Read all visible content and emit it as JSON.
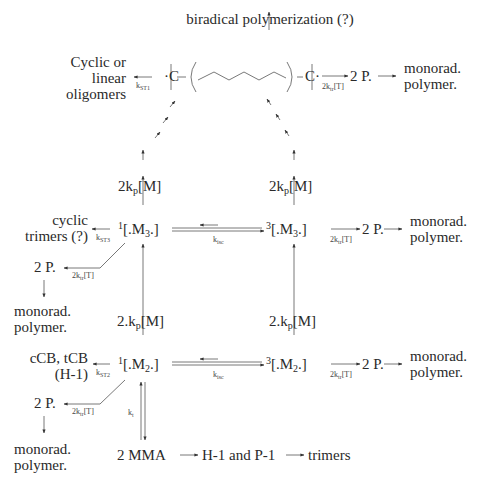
{
  "diagram": {
    "type": "reaction-scheme",
    "top": {
      "biradical_label": "biradical polymerization (?)",
      "left_product": [
        "Cyclic or",
        "linear",
        "oligomers"
      ],
      "k_st1": "ST1",
      "k_st1_prefix": "k",
      "chain_left_carbon": "C",
      "chain_right_carbon": "C",
      "transfer_rate_top": "2k",
      "transfer_rate_top_sub": "tr",
      "transfer_rate_top_suffix": "[T]",
      "product": "2 P.",
      "final": [
        "monorad.",
        "polymer."
      ]
    },
    "trimer_row": {
      "singlet_sup": "1",
      "singlet_body": "[.M",
      "singlet_sub": "3",
      "singlet_end": ".]",
      "triplet_sup": "3",
      "triplet_body": "[.M",
      "triplet_sub": "3",
      "triplet_end": ".]",
      "k_isc_prefix": "k",
      "k_isc_sub": "isc",
      "k_st3_prefix": "k",
      "k_st3_sub": "ST3",
      "left_product": [
        "cyclic",
        "trimers (?)"
      ],
      "left_2p": "2 P.",
      "left_rate_prefix": "2k",
      "left_rate_sub": "tr",
      "left_rate_suffix": "[T]",
      "left_final": [
        "monorad.",
        "polymer."
      ],
      "right_rate_prefix": "2k",
      "right_rate_sub": "tr",
      "right_rate_suffix": "[T]",
      "right_2p": "2 P.",
      "right_final": [
        "monorad.",
        "polymer."
      ],
      "up_rate_left_prefix": "2k",
      "up_rate_left_sub": "p",
      "up_rate_left_suffix": "[M]",
      "up_rate_right_prefix": "2k",
      "up_rate_right_sub": "p",
      "up_rate_right_suffix": "[M]"
    },
    "dimer_row": {
      "singlet_sup": "1",
      "singlet_body": "[.M",
      "singlet_sub": "2",
      "singlet_end": ".]",
      "triplet_sup": "3",
      "triplet_body": "[.M",
      "triplet_sub": "2",
      "triplet_end": ".]",
      "k_isc_prefix": "k",
      "k_isc_sub": "isc",
      "k_st2_prefix": "k",
      "k_st2_sub": "ST2",
      "left_product": [
        "cCB, tCB",
        "(H-1)"
      ],
      "left_2p": "2 P.",
      "left_rate_prefix": "2k",
      "left_rate_sub": "tr",
      "left_rate_suffix": "[T]",
      "left_final": [
        "monorad.",
        "polymer."
      ],
      "right_rate_prefix": "2k",
      "right_rate_sub": "tr",
      "right_rate_suffix": "[T]",
      "right_2p": "2 P.",
      "right_final": [
        "monorad.",
        "polymer."
      ],
      "up_rate_left_prefix": "2.k",
      "up_rate_left_sub": "p",
      "up_rate_left_suffix": "[M]",
      "up_rate_right_prefix": "2.k",
      "up_rate_right_sub": "p",
      "up_rate_right_suffix": "[M]",
      "k_t_prefix": "k",
      "k_t_sub": "t"
    },
    "bottom": {
      "monomer": "2 MMA",
      "intermediate": "H-1 and P-1",
      "final": "trimers"
    }
  }
}
